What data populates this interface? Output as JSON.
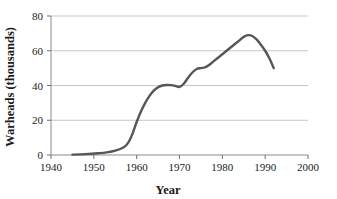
{
  "chart_data": {
    "type": "line",
    "title": "",
    "xlabel": "Year",
    "ylabel": "Warheads (thousands)",
    "xlim": [
      1940,
      2000
    ],
    "ylim": [
      0,
      80
    ],
    "xticks": [
      1940,
      1950,
      1960,
      1970,
      1980,
      1990,
      2000
    ],
    "xtick_labels": [
      "1940",
      "1950",
      "1960",
      "1970",
      "1980",
      "1990",
      "2000"
    ],
    "yticks": [
      0,
      20,
      40,
      60,
      80
    ],
    "ytick_labels": [
      "0",
      "20",
      "40",
      "60",
      "80"
    ],
    "grid": "horizontal",
    "legend": "none",
    "series": [
      {
        "name": "Warheads",
        "color": "#565656",
        "x": [
          1945,
          1948,
          1951,
          1953,
          1955,
          1957,
          1958,
          1959,
          1960,
          1961,
          1962,
          1963,
          1964,
          1965,
          1966,
          1967,
          1968,
          1969,
          1970,
          1971,
          1972,
          1973,
          1974,
          1975,
          1976,
          1977,
          1978,
          1979,
          1980,
          1981,
          1982,
          1983,
          1984,
          1985,
          1986,
          1987,
          1988,
          1989,
          1990,
          1991,
          1992
        ],
        "y": [
          0.2,
          0.5,
          1.0,
          1.5,
          2.5,
          4.5,
          7.0,
          12.0,
          19.0,
          25.0,
          30.0,
          34.0,
          37.0,
          39.0,
          40.0,
          40.3,
          40.2,
          39.8,
          39.2,
          41.0,
          44.5,
          47.5,
          49.5,
          50.0,
          50.5,
          52.0,
          54.0,
          56.0,
          58.0,
          60.0,
          62.0,
          64.0,
          66.0,
          68.0,
          69.0,
          68.5,
          66.5,
          63.5,
          60.0,
          55.5,
          50.0
        ]
      }
    ]
  },
  "axis_titles": {
    "x": "Year",
    "y": "Warheads (thousands)"
  }
}
